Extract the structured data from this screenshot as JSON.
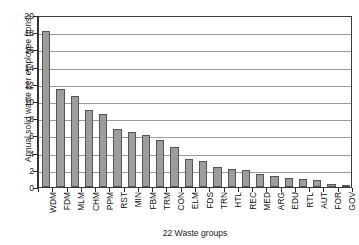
{
  "chart_data": {
    "type": "bar",
    "title": "",
    "xlabel": "22 Waste groups",
    "ylabel": "Annual solid waste per employee (tons)",
    "ylim": [
      0,
      20
    ],
    "ytick_step": 2,
    "yticks": [
      20,
      18,
      16,
      14,
      12,
      10,
      8,
      6,
      4,
      2,
      0
    ],
    "grid": "horizontal",
    "legend": "none",
    "bar_color": "#9d9d9d",
    "bar_edge_color": "#555555",
    "categories": [
      "WDM",
      "FDM",
      "MLM",
      "CHM",
      "PPM",
      "RST",
      "MIN",
      "FBM",
      "TRM",
      "CON",
      "ELM",
      "FDS",
      "TRN",
      "HTL",
      "REC",
      "MED",
      "ARG",
      "EDU",
      "RTL",
      "AUT",
      "FOR",
      "GOV"
    ],
    "values": [
      18.1,
      11.4,
      10.6,
      8.9,
      8.5,
      6.7,
      6.4,
      6.0,
      5.45,
      4.6,
      3.3,
      3.05,
      2.3,
      2.1,
      1.95,
      1.55,
      1.3,
      1.1,
      0.9,
      0.85,
      0.4,
      0.2
    ]
  }
}
